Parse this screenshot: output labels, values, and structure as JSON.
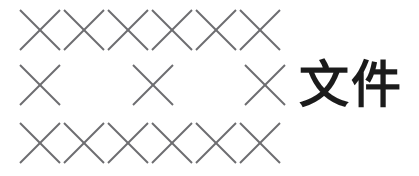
{
  "page": {
    "title": "文件",
    "background_color": "#ffffff",
    "width": 419,
    "height": 176
  },
  "label": {
    "text": "文件",
    "color": "#1b1b1b",
    "font_size_px": 50
  },
  "marks": {
    "glyph": "x-mark",
    "stroke_color": "#6d6d70",
    "stroke_width_px": 1.9,
    "size_px": 44,
    "rows": [
      {
        "name": "row-1",
        "count": 6,
        "top_px": 8,
        "x_positions": [
          18,
          62,
          106,
          150,
          194,
          238
        ]
      },
      {
        "name": "row-2",
        "count": 3,
        "top_px": 63,
        "x_positions": [
          18,
          131,
          243
        ]
      },
      {
        "name": "row-3",
        "count": 6,
        "top_px": 121,
        "x_positions": [
          18,
          62,
          106,
          150,
          194,
          238
        ]
      }
    ]
  }
}
